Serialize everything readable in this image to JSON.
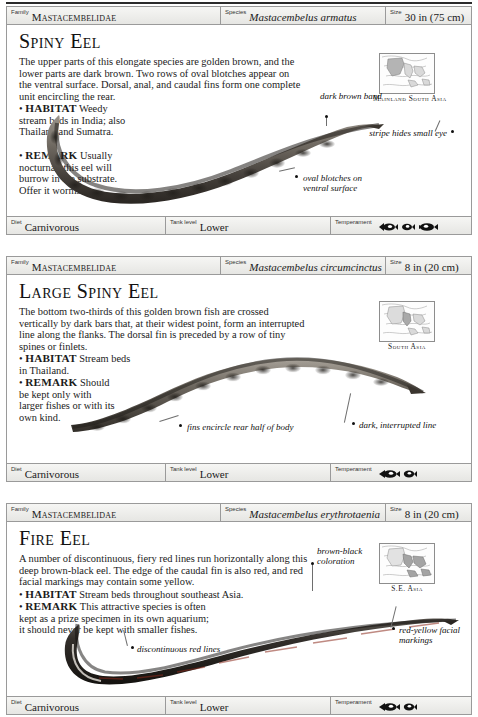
{
  "page": {
    "background": "#ffffff",
    "ink": "#1a1a1a",
    "rule_color": "#2b2b2b",
    "bar_fill": "#eeeeec",
    "bar_border": "#9a9a9a"
  },
  "field_labels": {
    "family": "Family",
    "species": "Species",
    "size": "Size",
    "diet": "Diet",
    "tank_level": "Tank level",
    "temperament": "Temperament"
  },
  "entries": [
    {
      "id": "spiny-eel",
      "family": "Mastacembelidae",
      "species": "Mastacembelus armatus",
      "size": "30 in (75 cm)",
      "title": "Spiny Eel",
      "description": "The upper parts of this elongate species are golden brown, and the lower parts are dark brown. Two rows of oval blotches appear on the ventral surface. Dorsal, anal, and caudal fins form one complete unit encircling the rear.",
      "habitat_label": "HABITAT",
      "habitat": "Weedy stream beds in India; also Thailand and Sumatra.",
      "remark_label": "REMARK",
      "remark": "Usually nocturnal, this eel will burrow in the substrate. Offer it worms.",
      "map_caption": "Mainland South Asia",
      "annotations": [
        {
          "name": "dark-brown-band",
          "text": "dark brown band"
        },
        {
          "name": "stripe-hides-small-eye",
          "text": "stripe hides small eye"
        },
        {
          "name": "oval-blotches-on-ventral-surface",
          "text": "oval blotches on ventral surface"
        }
      ],
      "diet": "Carnivorous",
      "tank_level": "Lower",
      "temperament_icons": 3
    },
    {
      "id": "large-spiny-eel",
      "family": "Mastacembelidae",
      "species": "Mastacembelus circumcinctus",
      "size": "8 in (20 cm)",
      "title": "Large Spiny Eel",
      "description": "The bottom two-thirds of this golden brown fish are crossed vertically by dark bars that, at their widest point, form an interrupted line along the flanks. The dorsal fin is preceded by a row of tiny spines or finlets.",
      "habitat_label": "HABITAT",
      "habitat": "Stream beds in Thailand.",
      "remark_label": "REMARK",
      "remark": "Should be kept only with larger fishes or with its own kind.",
      "map_caption": "South Asia",
      "annotations": [
        {
          "name": "fins-encircle-rear-half-of-body",
          "text": "fins encircle rear half of body"
        },
        {
          "name": "dark-interrupted-line",
          "text": "dark, interrupted line"
        }
      ],
      "diet": "Carnivorous",
      "tank_level": "Lower",
      "temperament_icons": 2
    },
    {
      "id": "fire-eel",
      "family": "Mastacembelidae",
      "species": "Mastacembelus erythrotaenia",
      "size": "8 in (20 cm)",
      "title": "Fire Eel",
      "description": "A number of discontinuous, fiery red lines run horizontally along this deep brown-black eel. The edge of the caudal fin is also red, and red facial markings may contain some yellow.",
      "habitat_label": "HABITAT",
      "habitat": "Stream beds throughout southeast Asia.",
      "remark_label": "REMARK",
      "remark": "This attractive species is often kept as a prize specimen in its own aquarium; it should never be kept with smaller fishes.",
      "map_caption": "S.E. Asia",
      "annotations": [
        {
          "name": "brown-black-coloration",
          "text": "brown-black coloration"
        },
        {
          "name": "discontinuous-red-lines",
          "text": "discontinuous red lines"
        },
        {
          "name": "red-yellow-facial-markings",
          "text": "red-yellow facial markings"
        }
      ],
      "diet": "Carnivorous",
      "tank_level": "Lower",
      "temperament_icons": 2
    }
  ]
}
